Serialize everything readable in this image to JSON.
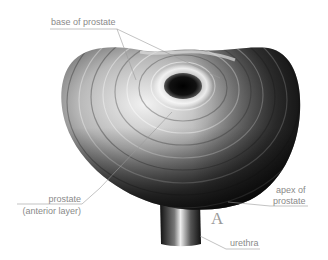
{
  "figure": {
    "plate_letter": "A",
    "colors": {
      "background": "#ffffff",
      "label_text": "#8a8a8a",
      "leader_line": "#9a9a9a",
      "tissue_dark": "#1a1a1a",
      "tissue_light": "#e8e8e8"
    },
    "labels": {
      "base": "base of prostate",
      "anterior_line1": "prostate",
      "anterior_line2": "(anterior layer)",
      "apex_line1": "apex of",
      "apex_line2": "prostate",
      "urethra": "urethra"
    }
  }
}
